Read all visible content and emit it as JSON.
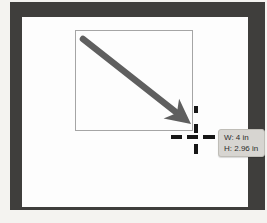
{
  "tooltip": {
    "width_label": "W: 4 in",
    "height_label": "H: 2.96 in"
  },
  "colors": {
    "page_background": "#f4f3f0",
    "bezel": "#3f3e3c",
    "canvas": "#fdfdfd",
    "selection_border": "#a5a5a5",
    "arrow": "#5f5f5f",
    "crosshair": "#161616",
    "tooltip_background": "#d7d5d1",
    "tooltip_border": "#bfbdb7",
    "tooltip_text": "#2d2d2d"
  }
}
